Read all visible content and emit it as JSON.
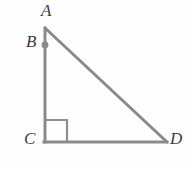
{
  "figure": {
    "background_color": "#fefefe",
    "stroke_color": "#8a8a8a",
    "label_color": "#3a3a3a",
    "marker_color": "#8a8a8a"
  },
  "labels": {
    "a": "A",
    "b": "B",
    "c": "C",
    "d": "D"
  },
  "geometry": {
    "points": {
      "A": {
        "x": 45,
        "y": 28
      },
      "B": {
        "x": 45,
        "y": 45
      },
      "C": {
        "x": 45,
        "y": 142
      },
      "D": {
        "x": 167,
        "y": 142
      }
    },
    "segments": [
      {
        "name": "AC",
        "from": "A",
        "to": "C"
      },
      {
        "name": "CD",
        "from": "C",
        "to": "D"
      },
      {
        "name": "AD",
        "from": "A",
        "to": "D"
      }
    ],
    "right_angle": {
      "vertex": "C",
      "size": 22
    },
    "point_markers": [
      "B"
    ],
    "stroke_width": 3
  }
}
